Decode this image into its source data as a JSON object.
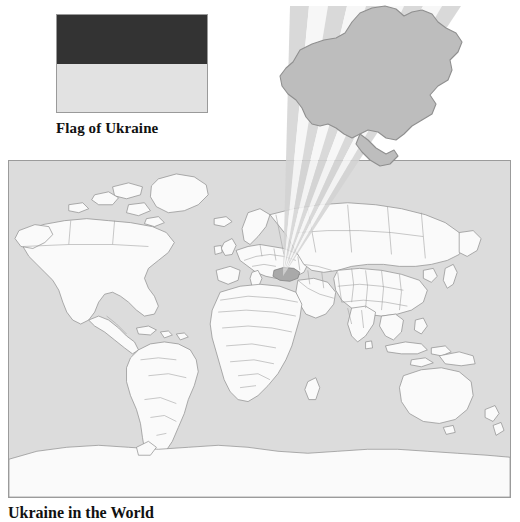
{
  "figure": {
    "flag": {
      "caption": "Flag of Ukraine",
      "alt_name": "flag-of-ukraine",
      "bands": [
        {
          "name": "upper-band",
          "color": "#333333"
        },
        {
          "name": "lower-band",
          "color": "#e2e2e2"
        }
      ],
      "border_color": "#9a9a9a"
    },
    "map": {
      "caption": "Ukraine in the World",
      "alt_name": "world-locator-map",
      "ocean_color": "#dcdcdc",
      "land_color": "#fafafa",
      "land_outline_color": "#8c8c8c",
      "border_color": "#9b9b9b",
      "highlight_color": "#b0b0b0",
      "highlight_country": "Ukraine"
    },
    "inset": {
      "alt_name": "ukraine-inset",
      "shape_fill": "#bdbdbd",
      "shape_outline": "#8f8f8f",
      "cone": {
        "name": "magnifier-cone",
        "apex_x": 283,
        "apex_y": 276,
        "stripe_colors": [
          "#d0d0d0",
          "#f4f4f4"
        ],
        "stripe_count": 9
      }
    }
  }
}
